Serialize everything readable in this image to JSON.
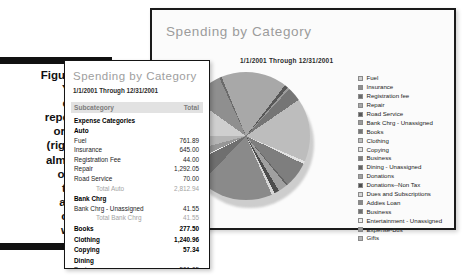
{
  "figure": {
    "label": "Figure 14-2:",
    "caption_lines": [
      "You can",
      "create a",
      "report (left)",
      "or a chart",
      "(right) with",
      "almost any",
      "option in",
      "the Pick",
      "a Report",
      "or Chart",
      "window."
    ]
  },
  "chart_window": {
    "title": "Spending by Category",
    "subtitle": "1/1/2001 Through 12/31/2001"
  },
  "report_window": {
    "title": "Spending by Category",
    "date_range": "1/1/2001 Through 12/31/2001",
    "columns": {
      "subcategory": "Subcategory",
      "total": "Total"
    },
    "section_header": "Expense Categories",
    "rows": [
      {
        "type": "group",
        "label": "Auto",
        "value": ""
      },
      {
        "type": "item",
        "label": "Fuel",
        "value": "761.89"
      },
      {
        "type": "item",
        "label": "Insurance",
        "value": "645.00"
      },
      {
        "type": "item",
        "label": "Registration Fee",
        "value": "44.00"
      },
      {
        "type": "item",
        "label": "Repair",
        "value": "1,292.05"
      },
      {
        "type": "item",
        "label": "Road Service",
        "value": "70.00"
      },
      {
        "type": "total",
        "label": "Total Auto",
        "value": "2,812.94"
      },
      {
        "type": "group",
        "label": "Bank Chrg",
        "value": ""
      },
      {
        "type": "item",
        "label": "Bank Chrg - Unassigned",
        "value": "41.55"
      },
      {
        "type": "total",
        "label": "Total Bank Chrg",
        "value": "41.55"
      },
      {
        "type": "group",
        "label": "Books",
        "value": "277.50"
      },
      {
        "type": "group",
        "label": "Clothing",
        "value": "1,240.96"
      },
      {
        "type": "group",
        "label": "Copying",
        "value": "57.34"
      },
      {
        "type": "group",
        "label": "Dining",
        "value": ""
      },
      {
        "type": "item",
        "label": "Business",
        "value": "501.05"
      },
      {
        "type": "item",
        "label": "Dining - Unassigned",
        "value": "32.21"
      },
      {
        "type": "total",
        "label": "Total Dining",
        "value": "533.26"
      }
    ]
  },
  "chart_data": {
    "type": "pie",
    "title": "Spending by Category",
    "subtitle": "1/1/2001 Through 12/31/2001",
    "legend_position": "right",
    "categories": [
      "Fuel",
      "Insurance",
      "Registration fee",
      "Repair",
      "Road Service",
      "Bank Chrg - Unassigned",
      "Books",
      "Clothing",
      "Copying",
      "Business",
      "Dining - Unassigned",
      "Donations",
      "Donations--Non Tax",
      "Dues and Subscriptions",
      "Addies Loan",
      "Business",
      "Entertainment - Unassigned",
      "Expense-Bus",
      "Gifts"
    ],
    "values": [
      761.89,
      645.0,
      44.0,
      1292.05,
      70.0,
      41.55,
      277.5,
      1240.96,
      57.34,
      501.05,
      32.21,
      180.0,
      95.0,
      60.0,
      1450.0,
      420.0,
      38.0,
      210.0,
      330.0
    ],
    "colors": [
      "#cfcfcf",
      "#8f8f8f",
      "#6b6b6b",
      "#a8a8a8",
      "#585858",
      "#9b9b9b",
      "#757575",
      "#bdbdbd",
      "#e2e2e2",
      "#7e7e7e",
      "#636363",
      "#a0a0a0",
      "#4d4d4d",
      "#d6d6d6",
      "#8a8a8a",
      "#6f6f6f",
      "#efefef",
      "#969696",
      "#b5b5b5"
    ]
  }
}
